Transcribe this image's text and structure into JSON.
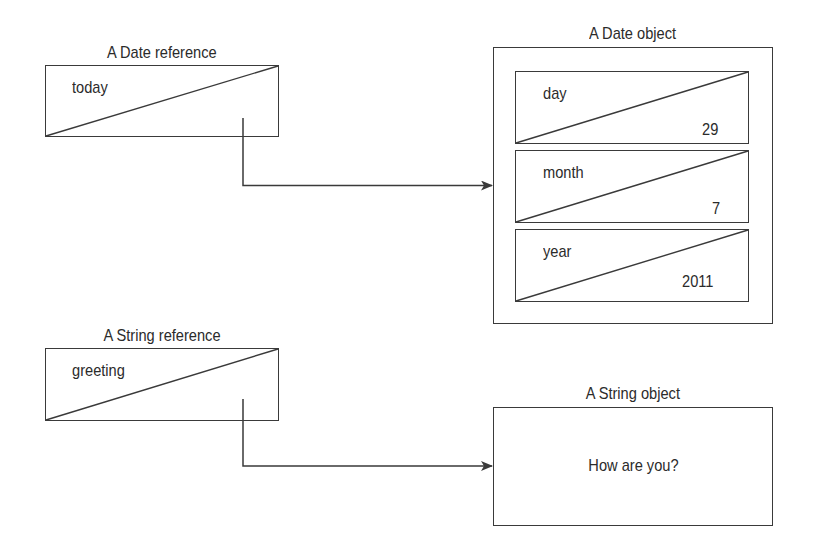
{
  "date_reference": {
    "caption": "A Date reference",
    "variable_name": "today"
  },
  "date_object": {
    "caption": "A Date object",
    "fields": [
      {
        "name": "day",
        "value": "29"
      },
      {
        "name": "month",
        "value": "7"
      },
      {
        "name": "year",
        "value": "2011"
      }
    ]
  },
  "string_reference": {
    "caption": "A String reference",
    "variable_name": "greeting"
  },
  "string_object": {
    "caption": "A String object",
    "value": "How are you?"
  },
  "colors": {
    "line": "#3a3a3a",
    "text": "#2b2b2b",
    "background": "#ffffff"
  }
}
